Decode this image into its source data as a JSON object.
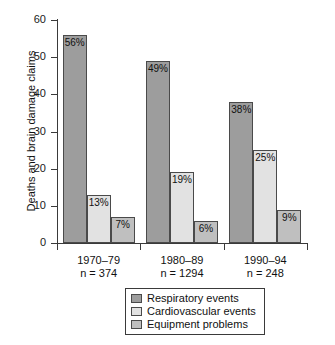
{
  "chart_data": {
    "type": "bar",
    "title": "",
    "xlabel": "",
    "ylabel": "Deaths and brain damage claims",
    "ylim": [
      0,
      60
    ],
    "yticks": [
      0,
      10,
      20,
      30,
      40,
      50,
      60
    ],
    "grid": false,
    "legend_position": "bottom-center",
    "categories": [
      "1970–79",
      "1980–89",
      "1990–94"
    ],
    "category_sublabels": [
      "n = 374",
      "n = 1294",
      "n = 248"
    ],
    "series": [
      {
        "name": "Respiratory events",
        "color": "#9d9d9d",
        "values": [
          56,
          49,
          38
        ],
        "labels": [
          "56%",
          "49%",
          "38%"
        ]
      },
      {
        "name": "Cardiovascular events",
        "color": "#e2e2e2",
        "values": [
          13,
          19,
          25
        ],
        "labels": [
          "13%",
          "19%",
          "25%"
        ]
      },
      {
        "name": "Equipment problems",
        "color": "#bfbfbf",
        "values": [
          7,
          6,
          9
        ],
        "labels": [
          "7%",
          "6%",
          "9%"
        ]
      }
    ]
  },
  "axis": {
    "y_title": "Deaths and brain damage claims",
    "y_tick_labels": [
      "60",
      "50",
      "40",
      "30",
      "20",
      "10",
      "0"
    ]
  },
  "legend": {
    "items": [
      {
        "label": "Respiratory events"
      },
      {
        "label": "Cardiovascular events"
      },
      {
        "label": "Equipment problems"
      }
    ]
  },
  "caption": {
    "title_cropped": "",
    "bottom_cropped": ""
  }
}
